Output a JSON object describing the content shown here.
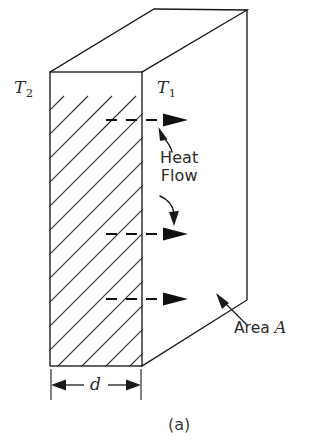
{
  "figure": {
    "caption": "(a)",
    "type": "heat-conduction-slab-diagram",
    "labels": {
      "temp_cold": "T",
      "temp_cold_sub": "2",
      "temp_hot": "T",
      "temp_hot_sub": "1",
      "heat_flow_line1": "Heat",
      "heat_flow_line2": "Flow",
      "area_text": "Area ",
      "area_symbol": "A",
      "thickness_symbol": "d"
    },
    "colors": {
      "stroke": "#1a1a1a",
      "hatch": "#2b2b2b",
      "background": "#ffffff",
      "arrow": "#111111"
    },
    "geometry": {
      "front_face": {
        "x1": 50,
        "y1": 72,
        "x2": 142,
        "y2": 366
      },
      "top_back_left": {
        "x": 154,
        "y": 9
      },
      "top_back_right": {
        "x": 247,
        "y": 10
      },
      "right_bottom": {
        "x": 247,
        "y": 300
      },
      "hatch_angle_deg": 45,
      "hatch_spacing_px": 24,
      "flow_arrow_rows_y": [
        120,
        234,
        299
      ],
      "flow_arrow_start_x": 105,
      "flow_arrow_end_x": 188,
      "dimension_line_y": 385,
      "dimension_x_start": 51,
      "dimension_x_end": 141
    }
  }
}
